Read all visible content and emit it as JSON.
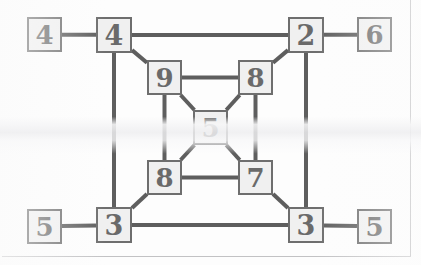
{
  "diagram": {
    "type": "node-link-diagram",
    "canvas": {
      "width": 421,
      "height": 265
    },
    "style": {
      "background_color": "#fdfdfd",
      "node_fill": "#f0f0f0",
      "node_border_color": "#6e6e6e",
      "node_border_width": 2,
      "edge_color": "#5e5e5e",
      "edge_width": 4,
      "label_color": "#6a6a6a",
      "frame_color": "#b9b9bb"
    },
    "frame": {
      "right_line_x": 410,
      "right_line_top": 0,
      "right_line_height": 257,
      "bottom_line_y": 256,
      "bottom_line_left": 2,
      "bottom_line_width": 409
    },
    "nodes": [
      {
        "id": "L-TL",
        "name": "leaf-top-left",
        "label": "4",
        "x": 27,
        "y": 17,
        "size": 35,
        "font_size": 26
      },
      {
        "id": "O-TL",
        "name": "outer-top-left",
        "label": "4",
        "x": 96,
        "y": 17,
        "size": 36,
        "font_size": 27
      },
      {
        "id": "O-TR",
        "name": "outer-top-right",
        "label": "2",
        "x": 288,
        "y": 17,
        "size": 36,
        "font_size": 27
      },
      {
        "id": "L-TR",
        "name": "leaf-top-right",
        "label": "6",
        "x": 357,
        "y": 17,
        "size": 35,
        "font_size": 26
      },
      {
        "id": "I-TL",
        "name": "inner-top-left",
        "label": "9",
        "x": 147,
        "y": 60,
        "size": 35,
        "font_size": 26
      },
      {
        "id": "I-TR",
        "name": "inner-top-right",
        "label": "8",
        "x": 238,
        "y": 60,
        "size": 35,
        "font_size": 26
      },
      {
        "id": "C",
        "name": "center-node",
        "label": "5",
        "x": 193,
        "y": 110,
        "size": 35,
        "font_size": 26
      },
      {
        "id": "I-BL",
        "name": "inner-bottom-left",
        "label": "8",
        "x": 147,
        "y": 160,
        "size": 35,
        "font_size": 26
      },
      {
        "id": "I-BR",
        "name": "inner-bottom-right",
        "label": "7",
        "x": 238,
        "y": 160,
        "size": 35,
        "font_size": 26
      },
      {
        "id": "L-BL",
        "name": "leaf-bottom-left",
        "label": "5",
        "x": 27,
        "y": 209,
        "size": 35,
        "font_size": 26
      },
      {
        "id": "O-BL",
        "name": "outer-bottom-left",
        "label": "3",
        "x": 96,
        "y": 207,
        "size": 36,
        "font_size": 27
      },
      {
        "id": "O-BR",
        "name": "outer-bottom-right",
        "label": "3",
        "x": 288,
        "y": 207,
        "size": 36,
        "font_size": 27
      },
      {
        "id": "L-BR",
        "name": "leaf-bottom-right",
        "label": "5",
        "x": 357,
        "y": 209,
        "size": 35,
        "font_size": 26
      }
    ],
    "edges": [
      {
        "name": "edge-leaf-tl-to-outer-tl",
        "from": "L-TL",
        "to": "O-TL",
        "kind": "horizontal"
      },
      {
        "name": "edge-outer-tl-to-outer-tr",
        "from": "O-TL",
        "to": "O-TR",
        "kind": "horizontal"
      },
      {
        "name": "edge-outer-tr-to-leaf-tr",
        "from": "O-TR",
        "to": "L-TR",
        "kind": "horizontal"
      },
      {
        "name": "edge-leaf-bl-to-outer-bl",
        "from": "L-BL",
        "to": "O-BL",
        "kind": "horizontal"
      },
      {
        "name": "edge-outer-bl-to-outer-br",
        "from": "O-BL",
        "to": "O-BR",
        "kind": "horizontal"
      },
      {
        "name": "edge-outer-br-to-leaf-br",
        "from": "O-BR",
        "to": "L-BR",
        "kind": "horizontal"
      },
      {
        "name": "edge-outer-tl-to-outer-bl",
        "from": "O-TL",
        "to": "O-BL",
        "kind": "vertical"
      },
      {
        "name": "edge-outer-tr-to-outer-br",
        "from": "O-TR",
        "to": "O-BR",
        "kind": "vertical"
      },
      {
        "name": "edge-inner-tl-to-inner-tr",
        "from": "I-TL",
        "to": "I-TR",
        "kind": "horizontal"
      },
      {
        "name": "edge-inner-bl-to-inner-br",
        "from": "I-BL",
        "to": "I-BR",
        "kind": "horizontal"
      },
      {
        "name": "edge-inner-tl-to-inner-bl",
        "from": "I-TL",
        "to": "I-BL",
        "kind": "vertical"
      },
      {
        "name": "edge-inner-tr-to-inner-br",
        "from": "I-TR",
        "to": "I-BR",
        "kind": "vertical"
      },
      {
        "name": "edge-outer-tl-to-inner-tl",
        "from": "O-TL",
        "to": "I-TL",
        "kind": "diagonal"
      },
      {
        "name": "edge-outer-tr-to-inner-tr",
        "from": "O-TR",
        "to": "I-TR",
        "kind": "diagonal"
      },
      {
        "name": "edge-outer-bl-to-inner-bl",
        "from": "O-BL",
        "to": "I-BL",
        "kind": "diagonal"
      },
      {
        "name": "edge-outer-br-to-inner-br",
        "from": "O-BR",
        "to": "I-BR",
        "kind": "diagonal"
      },
      {
        "name": "edge-inner-tl-to-center",
        "from": "I-TL",
        "to": "C",
        "kind": "diagonal"
      },
      {
        "name": "edge-inner-tr-to-center",
        "from": "I-TR",
        "to": "C",
        "kind": "diagonal"
      },
      {
        "name": "edge-inner-bl-to-center",
        "from": "I-BL",
        "to": "C",
        "kind": "diagonal"
      },
      {
        "name": "edge-inner-br-to-center",
        "from": "I-BR",
        "to": "C",
        "kind": "diagonal"
      }
    ]
  }
}
